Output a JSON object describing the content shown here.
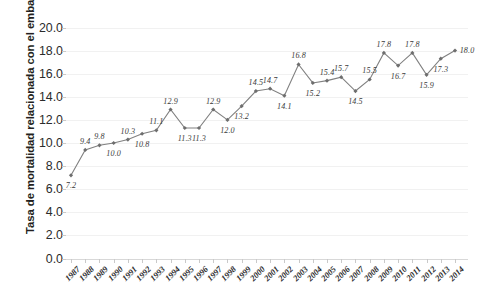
{
  "chart_data": {
    "type": "line",
    "title": "",
    "xlabel": "",
    "ylabel": "Tasa de mortalidad relacionada con el embarazo*",
    "ylim": [
      0.0,
      20.0
    ],
    "ytick_step": 2.0,
    "grid": true,
    "legend": "none",
    "line_color": "#808080",
    "marker": "diamond",
    "marker_color": "#6e6e6e",
    "categories": [
      "1987",
      "1988",
      "1989",
      "1990",
      "1991",
      "1992",
      "1993",
      "1994",
      "1995",
      "1996",
      "1997",
      "1998",
      "1999",
      "2000",
      "2001",
      "2002",
      "2003",
      "2004",
      "2005",
      "2006",
      "2007",
      "2008",
      "2009",
      "2010",
      "2011",
      "2012",
      "2013",
      "2014"
    ],
    "values": [
      7.2,
      9.4,
      9.8,
      10.0,
      10.3,
      10.8,
      11.1,
      12.9,
      11.3,
      11.3,
      12.9,
      12.0,
      13.2,
      14.5,
      14.7,
      14.1,
      16.8,
      15.2,
      15.4,
      15.7,
      14.5,
      15.5,
      17.8,
      16.7,
      17.8,
      15.9,
      17.3,
      18.0
    ],
    "data_labels": [
      "7.2",
      "9.4",
      "9.8",
      "10.0",
      "10.3",
      "10.8",
      "11.1",
      "12.9",
      "11.3",
      "11.3",
      "12.9",
      "12.0",
      "13.2",
      "14.5",
      "14.7",
      "14.1",
      "16.8",
      "15.2",
      "15.4",
      "15.7",
      "14.5",
      "15.5",
      "17.8",
      "16.7",
      "17.8",
      "15.9",
      "17.3",
      "18.0"
    ],
    "yticks": [
      "0.0",
      "2.0",
      "4.0",
      "6.0",
      "8.0",
      "10.0",
      "12.0",
      "14.0",
      "16.0",
      "18.0",
      "20.0"
    ]
  }
}
